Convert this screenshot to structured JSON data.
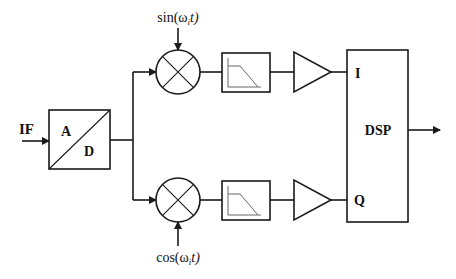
{
  "diagram": {
    "type": "IQ demodulator block diagram",
    "input_label": "IF",
    "adc": {
      "label_top": "A",
      "label_bottom": "D"
    },
    "mixers": [
      {
        "name": "upper-mixer",
        "lo_label": "sin(ω",
        "lo_sub": "i",
        "lo_tail": "t)"
      },
      {
        "name": "lower-mixer",
        "lo_label": "cos(ω",
        "lo_sub": "i",
        "lo_tail": "t)"
      }
    ],
    "filters": [
      {
        "name": "upper-lowpass-filter"
      },
      {
        "name": "lower-lowpass-filter"
      }
    ],
    "amplifiers": [
      {
        "name": "upper-amplifier"
      },
      {
        "name": "lower-amplifier"
      }
    ],
    "dsp": {
      "label": "DSP",
      "input_i": "I",
      "input_q": "Q"
    },
    "colors": {
      "line": "#1a1a1a",
      "background": "#ffffff",
      "filter_curve": "#666666"
    }
  }
}
